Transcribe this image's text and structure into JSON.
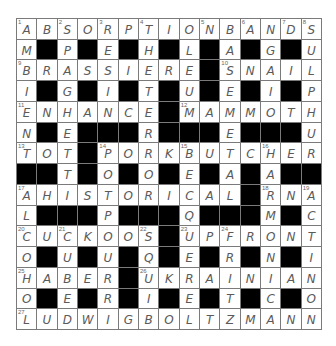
{
  "puzzle": {
    "rows": 15,
    "cols": 15,
    "grid": [
      "ABSORPTIONBANDS",
      "M#P#E#H#L#A#G#U",
      "BRASSIERE#SNAIL",
      "I#G#I#T#U#E#I#P",
      "ENHANCE#MAMMOTH",
      "N#E###R###E###U",
      "TOT#PORKBUTCHER",
      "##T#O#O#E#A#A##",
      "AHISTORICAL#RNA",
      "L###P###Q###M#C",
      "CUCKOOS#UPFRONT",
      "O#U#U#Q#E#R#N#I",
      "HABER#UKRAINIAN",
      "O#E#R#I#E#T#C#O",
      "LUDWIGBOLTZMANN"
    ],
    "numbers": [
      {
        "r": 0,
        "c": 0,
        "n": "1"
      },
      {
        "r": 0,
        "c": 2,
        "n": "2"
      },
      {
        "r": 0,
        "c": 4,
        "n": "3"
      },
      {
        "r": 0,
        "c": 6,
        "n": "4"
      },
      {
        "r": 0,
        "c": 9,
        "n": "5"
      },
      {
        "r": 0,
        "c": 11,
        "n": "6"
      },
      {
        "r": 0,
        "c": 13,
        "n": "7"
      },
      {
        "r": 0,
        "c": 14,
        "n": "8"
      },
      {
        "r": 2,
        "c": 0,
        "n": "9"
      },
      {
        "r": 2,
        "c": 10,
        "n": "10"
      },
      {
        "r": 4,
        "c": 0,
        "n": "11"
      },
      {
        "r": 4,
        "c": 8,
        "n": "12"
      },
      {
        "r": 6,
        "c": 0,
        "n": "13"
      },
      {
        "r": 6,
        "c": 4,
        "n": "14"
      },
      {
        "r": 6,
        "c": 8,
        "n": "15"
      },
      {
        "r": 6,
        "c": 12,
        "n": "16"
      },
      {
        "r": 8,
        "c": 0,
        "n": "17"
      },
      {
        "r": 8,
        "c": 12,
        "n": "18"
      },
      {
        "r": 8,
        "c": 14,
        "n": "19"
      },
      {
        "r": 10,
        "c": 0,
        "n": "20"
      },
      {
        "r": 10,
        "c": 2,
        "n": "21"
      },
      {
        "r": 10,
        "c": 6,
        "n": "22"
      },
      {
        "r": 10,
        "c": 8,
        "n": "23"
      },
      {
        "r": 10,
        "c": 10,
        "n": "24"
      },
      {
        "r": 12,
        "c": 0,
        "n": "25"
      },
      {
        "r": 12,
        "c": 6,
        "n": "26"
      },
      {
        "r": 14,
        "c": 0,
        "n": "27"
      }
    ]
  },
  "colors": {
    "block": "#000000",
    "cell": "#ffffff",
    "gridline": "#7a7a7a",
    "letter": "#5a5a5a"
  }
}
